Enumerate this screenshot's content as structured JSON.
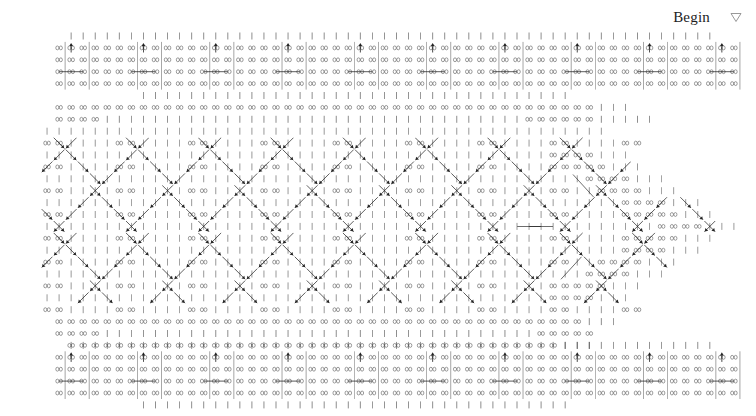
{
  "page": {
    "background_color": "#ffffff",
    "width": 756,
    "height": 416,
    "ink_color": "#3a3a3a",
    "ink_color_strong": "#1d1d1d"
  },
  "header": {
    "begin_label": "Begin",
    "dropdown_icon": "triangle-down-icon"
  },
  "grid": {
    "origin_x": 35,
    "origin_y": 36,
    "cell_w": 12.05,
    "cell_h": 11.9,
    "cols": 59,
    "rows": [
      {
        "index": 0,
        "y": 36,
        "pattern": "ticks",
        "col_start": 3,
        "col_end": 56
      },
      {
        "index": 1,
        "y": 48,
        "pattern": "inf-box",
        "col_start": 2,
        "col_end": 58
      },
      {
        "index": 2,
        "y": 60,
        "pattern": "inf-box",
        "col_start": 2,
        "col_end": 58
      },
      {
        "index": 3,
        "y": 72,
        "pattern": "inf-hline",
        "col_start": 2,
        "col_end": 58
      },
      {
        "index": 4,
        "y": 84,
        "pattern": "inf-box",
        "col_start": 2,
        "col_end": 58
      },
      {
        "index": 5,
        "y": 96,
        "pattern": "ticks",
        "col_start": 9,
        "col_end": 44
      },
      {
        "index": 6,
        "y": 108,
        "pattern": "inf-run",
        "col_start": 2,
        "col_end": 47
      },
      {
        "index": 7,
        "y": 120,
        "pattern": "mixed",
        "col_start": 2,
        "col_end": 51
      },
      {
        "index": 8,
        "y": 132,
        "pattern": "mixed",
        "col_start": 2,
        "col_end": 53
      },
      {
        "index": 9,
        "y": 144,
        "pattern": "diagonal",
        "col_start": 1,
        "col_end": 55
      },
      {
        "index": 10,
        "y": 156,
        "pattern": "diagonal",
        "col_start": 1,
        "col_end": 56
      },
      {
        "index": 11,
        "y": 168,
        "pattern": "diagonal",
        "col_start": 1,
        "col_end": 57
      },
      {
        "index": 12,
        "y": 180,
        "pattern": "diagonal",
        "col_start": 1,
        "col_end": 58
      },
      {
        "index": 13,
        "y": 192,
        "pattern": "diagonal",
        "col_start": 1,
        "col_end": 58
      },
      {
        "index": 14,
        "y": 204,
        "pattern": "diagonal",
        "col_start": 1,
        "col_end": 58
      },
      {
        "index": 15,
        "y": 216,
        "pattern": "diagonal",
        "col_start": 1,
        "col_end": 58
      },
      {
        "index": 16,
        "y": 228,
        "pattern": "diagonal",
        "col_start": 1,
        "col_end": 58
      },
      {
        "index": 17,
        "y": 240,
        "pattern": "diagonal",
        "col_start": 1,
        "col_end": 58
      },
      {
        "index": 18,
        "y": 252,
        "pattern": "diagonal",
        "col_start": 1,
        "col_end": 57
      },
      {
        "index": 19,
        "y": 264,
        "pattern": "diagonal",
        "col_start": 1,
        "col_end": 56
      },
      {
        "index": 20,
        "y": 276,
        "pattern": "diagonal",
        "col_start": 1,
        "col_end": 55
      },
      {
        "index": 21,
        "y": 288,
        "pattern": "diagonal",
        "col_start": 1,
        "col_end": 53
      },
      {
        "index": 22,
        "y": 300,
        "pattern": "mixed",
        "col_start": 2,
        "col_end": 51
      },
      {
        "index": 23,
        "y": 312,
        "pattern": "mixed",
        "col_start": 2,
        "col_end": 48
      },
      {
        "index": 24,
        "y": 324,
        "pattern": "inf-run",
        "col_start": 2,
        "col_end": 46
      },
      {
        "index": 25,
        "y": 336,
        "pattern": "ticks",
        "col_start": 3,
        "col_end": 44
      },
      {
        "index": 26,
        "y": 348,
        "pattern": "inf-run",
        "col_start": 3,
        "col_end": 44
      },
      {
        "index": 27,
        "y": 360,
        "pattern": "ticks",
        "col_start": 9,
        "col_end": 45
      },
      {
        "index": 28,
        "y": 372,
        "pattern": "inf-box",
        "col_start": 2,
        "col_end": 58
      },
      {
        "index": 29,
        "y": 384,
        "pattern": "inf-box",
        "col_start": 2,
        "col_end": 58
      },
      {
        "index": 30,
        "y": 396,
        "pattern": "inf-hline",
        "col_start": 2,
        "col_end": 58
      },
      {
        "index": 31,
        "y": 408,
        "pattern": "inf-box",
        "col_start": 2,
        "col_end": 58
      }
    ],
    "glyph_names": [
      "tick-glyph",
      "infinity-glyph",
      "arrow-up-glyph",
      "arrow-down-right-glyph",
      "arrow-down-left-glyph",
      "hline-glyph",
      "vline-glyph"
    ],
    "legend": {
      "tick": "|",
      "infinity": "∞",
      "arrow_up": "↑",
      "arrow_down_right": "↘",
      "arrow_down_left": "↙",
      "hline": "─",
      "vline": "│"
    },
    "bands": [
      {
        "name": "top-band",
        "row_start": 0,
        "row_end": 5,
        "kind": "regular"
      },
      {
        "name": "middle-band",
        "row_start": 6,
        "row_end": 25,
        "kind": "diagonal"
      },
      {
        "name": "bottom-band",
        "row_start": 26,
        "row_end": 31,
        "kind": "regular"
      }
    ],
    "regular_band": {
      "group_period": 6,
      "group_offset": 3,
      "arrow_up_row": 1,
      "hline_row": 3,
      "vline_row_start": 1,
      "vline_row_end": 4,
      "tick_rows": [
        0,
        5
      ],
      "infinity_rows": [
        1,
        2,
        3,
        4
      ]
    },
    "middle_band": {
      "diagonal_period": 6,
      "chevron_amplitude": 4,
      "staircase_edge": true,
      "edge_start_col": 52,
      "edge_slope": -1.35
    }
  }
}
